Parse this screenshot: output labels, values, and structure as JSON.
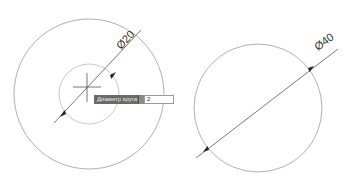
{
  "drawing": {
    "line_color": "#8c8c8c",
    "dim_color": "#444444",
    "left_outer_circle": {
      "cx": 89,
      "cy": 94,
      "r": 75
    },
    "left_inner_circle": {
      "cx": 89,
      "cy": 94,
      "r": 30
    },
    "crosshair": {
      "x": 87,
      "y": 87,
      "size": 14
    },
    "left_dimension": {
      "label": "Ø20",
      "line": {
        "x1": 54,
        "y1": 123,
        "x2": 141,
        "y2": 30
      },
      "arrow_a": {
        "x": 60,
        "y": 117
      },
      "arrow_b": {
        "x": 116,
        "y": 72
      }
    },
    "right_circle": {
      "cx": 258,
      "cy": 108,
      "r": 64
    },
    "right_dimension": {
      "label": "Ø40",
      "line": {
        "x1": 196,
        "y1": 158,
        "x2": 338,
        "y2": 49
      },
      "arrow_a": {
        "x": 203,
        "y": 152
      },
      "arrow_b": {
        "x": 314,
        "y": 66
      }
    }
  },
  "dynamic_input": {
    "prompt_label": "Диаметр круга",
    "value": "2"
  }
}
